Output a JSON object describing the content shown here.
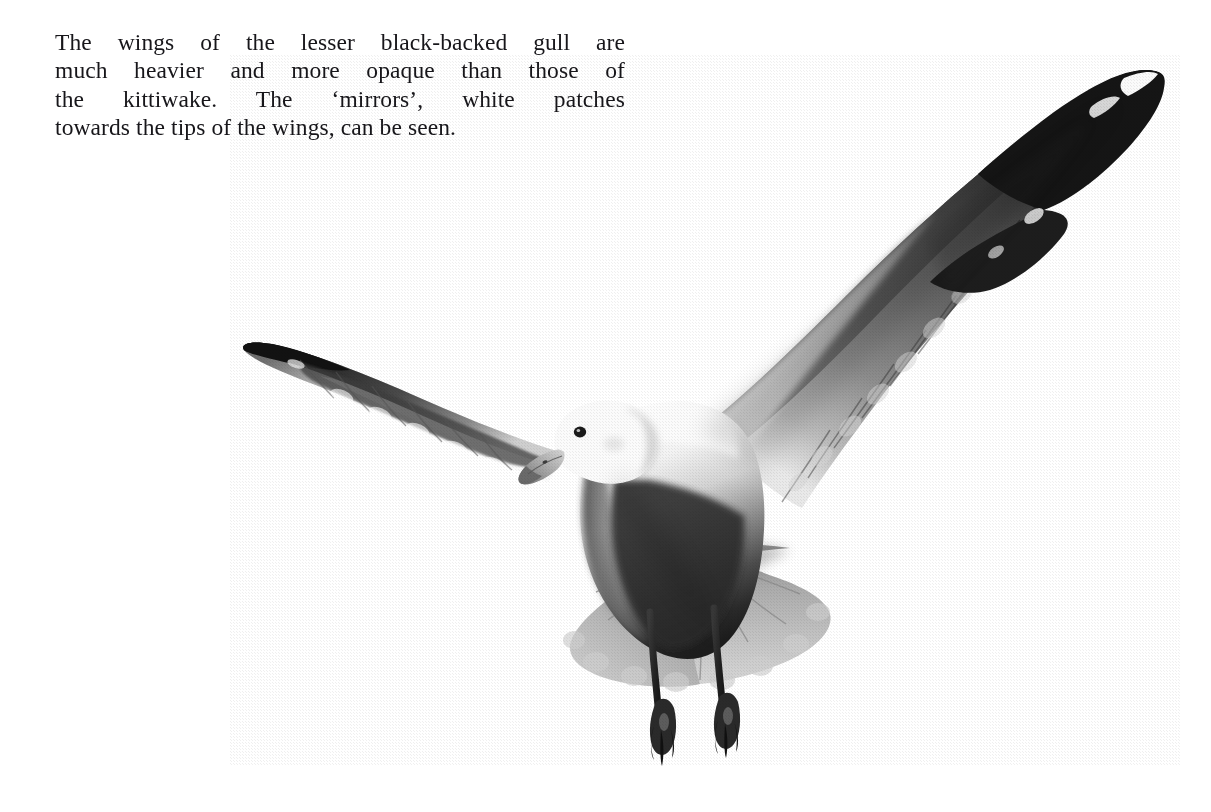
{
  "page": {
    "background_color": "#ffffff",
    "width": 1211,
    "height": 812
  },
  "caption": {
    "full_text": "The wings of the lesser black-backed gull are much heavier and more opaque than those of the kittiwake. The ‘mirrors’, white patches towards the tips of the wings, can be seen.",
    "text_color": "#17161a",
    "alignment": "justified",
    "lines": [
      "The wings of the lesser black-backed gull are",
      "much heavier and more opaque than those of",
      "the kittiwake. The ‘mirrors’, white patches",
      "towards the tips of the wings, can be seen."
    ]
  },
  "photograph": {
    "subject": "lesser black-backed gull in flight, seen from below and front",
    "medium": "black and white halftone print",
    "background_color": "#ffffff",
    "tones": {
      "darkest": "#141414",
      "wing_upper_dark": "#3a3a3a",
      "wing_mid_grey": "#707070",
      "underwing_light_grey": "#b9b9b9",
      "tail_grey": "#a8a8a8",
      "body_white": "#f7f7f7",
      "beak_grey": "#9a9a9a",
      "eye_dark": "#1d1d1d"
    },
    "features": [
      "right wing raised high to upper-right with dark upper surface",
      "left wing extended to the left with pale underside and dark leading edge",
      "white 'mirror' patches near both wing tips",
      "white head with dark eye and pale hooked bill",
      "fanned pale grey tail",
      "two dark webbed feet trailing below"
    ]
  }
}
